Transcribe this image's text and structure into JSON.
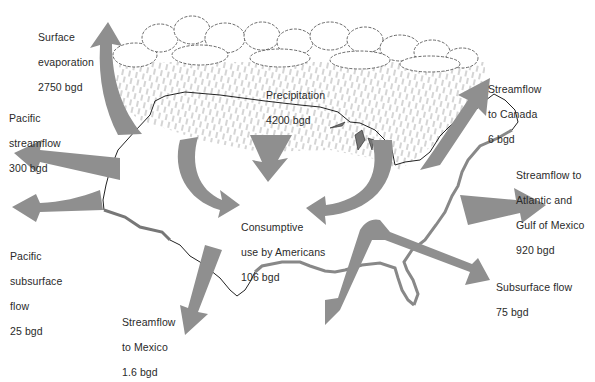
{
  "diagram": {
    "unit": "bgd",
    "colors": {
      "background": "#ffffff",
      "arrow": "#8f8f8f",
      "outline": "#222222",
      "coast_fill": "#9a9a9a",
      "text": "#2a2a2a",
      "rain": "#555555"
    },
    "icons": [
      "cloud-icon",
      "rain-icon",
      "us-map-outline",
      "flow-arrow"
    ],
    "labels": {
      "surface_evaporation": {
        "line1": "Surface",
        "line2": "evaporation",
        "value": "2750 bgd"
      },
      "precipitation": {
        "line1": "Precipitation",
        "value": "4200 bgd"
      },
      "streamflow_canada": {
        "line1": "Streamflow",
        "line2": "to Canada",
        "value": "6 bgd"
      },
      "pacific_streamflow": {
        "line1": "Pacific",
        "line2": "streamflow",
        "value": "300 bgd"
      },
      "streamflow_atlantic": {
        "line1": "Streamflow to",
        "line2": "Atlantic and",
        "line3": "Gulf of Mexico",
        "value": "920 bgd"
      },
      "pacific_subsurface": {
        "line1": "Pacific",
        "line2": "subsurface",
        "line3": "flow",
        "value": "25 bgd"
      },
      "consumptive_use": {
        "line1": "Consumptive",
        "line2": "use by Americans",
        "value": "106 bgd"
      },
      "subsurface_flow": {
        "line1": "Subsurface flow",
        "value": "75 bgd"
      },
      "streamflow_mexico": {
        "line1": "Streamflow",
        "line2": "to Mexico",
        "value": "1.6 bgd"
      }
    },
    "flows": [
      {
        "name": "Surface evaporation",
        "value": 2750,
        "direction": "up"
      },
      {
        "name": "Precipitation",
        "value": 4200,
        "direction": "down"
      },
      {
        "name": "Streamflow to Canada",
        "value": 6,
        "direction": "up-right"
      },
      {
        "name": "Pacific streamflow",
        "value": 300,
        "direction": "left"
      },
      {
        "name": "Streamflow to Atlantic and Gulf of Mexico",
        "value": 920,
        "direction": "right"
      },
      {
        "name": "Pacific subsurface flow",
        "value": 25,
        "direction": "left"
      },
      {
        "name": "Consumptive use by Americans",
        "value": 106,
        "direction": "inward"
      },
      {
        "name": "Subsurface flow",
        "value": 75,
        "direction": "right-down"
      },
      {
        "name": "Streamflow to Mexico",
        "value": 1.6,
        "direction": "down-left"
      }
    ]
  }
}
